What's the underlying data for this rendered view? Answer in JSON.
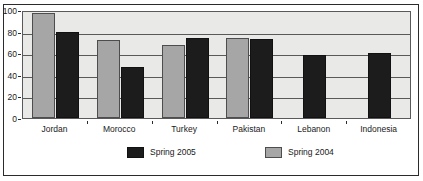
{
  "chart_data": {
    "type": "bar",
    "title": "",
    "subtitle": "",
    "xlabel": "",
    "ylabel": "",
    "ylim": [
      0,
      100
    ],
    "yticks": [
      0,
      20,
      40,
      60,
      80,
      100
    ],
    "ytick_labels": [
      "0",
      "20",
      "40",
      "60",
      "80",
      "100"
    ],
    "grid": true,
    "grid_axis": "y",
    "legend_position": "bottom",
    "categories": [
      "Jordan",
      "Morocco",
      "Turkey",
      "Pakistan",
      "Lebanon",
      "Indonesia"
    ],
    "series": [
      {
        "name": "Spring 2004",
        "color": "#a6a6a6",
        "values": [
          97,
          72,
          68,
          74,
          null,
          null
        ]
      },
      {
        "name": "Spring 2005",
        "color": "#1c1c1c",
        "values": [
          80,
          47,
          74,
          73,
          58,
          60
        ]
      }
    ],
    "series_draw_order": [
      "Spring 2004",
      "Spring 2005"
    ],
    "plot_background": "#e9e9e7",
    "axis_color": "#595959",
    "frame_color": "#2b2b2b"
  },
  "legend": {
    "entries": [
      {
        "label": "Spring 2005",
        "swatch": "s2005"
      },
      {
        "label": "Spring 2004",
        "swatch": "s2004"
      }
    ]
  }
}
